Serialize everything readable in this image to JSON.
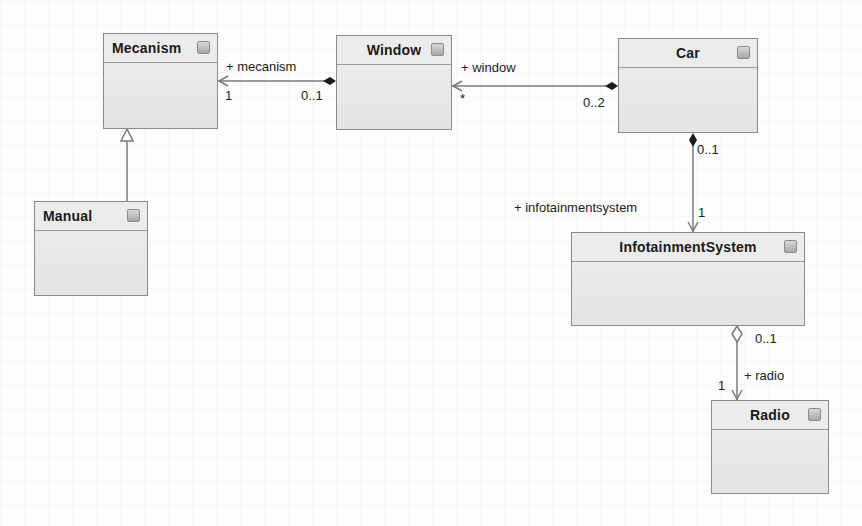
{
  "diagram": {
    "type": "UML class diagram",
    "classes": [
      {
        "id": "mecanism",
        "name": "Mecanism"
      },
      {
        "id": "window",
        "name": "Window"
      },
      {
        "id": "car",
        "name": "Car"
      },
      {
        "id": "manual",
        "name": "Manual"
      },
      {
        "id": "infotainment",
        "name": "InfotainmentSystem"
      },
      {
        "id": "radio",
        "name": "Radio"
      }
    ],
    "associations": [
      {
        "id": "window-mecanism",
        "from": "Window",
        "to": "Mecanism",
        "kind": "composition",
        "role": "+ mecanism",
        "source_multiplicity": "0..1",
        "target_multiplicity": "1"
      },
      {
        "id": "car-window",
        "from": "Car",
        "to": "Window",
        "kind": "composition",
        "role": "+ window",
        "source_multiplicity": "0..2",
        "target_multiplicity": "*"
      },
      {
        "id": "car-infotainment",
        "from": "Car",
        "to": "InfotainmentSystem",
        "kind": "composition",
        "role": "+ infotainmentsystem",
        "source_multiplicity": "0..1",
        "target_multiplicity": "1"
      },
      {
        "id": "infotainment-radio",
        "from": "InfotainmentSystem",
        "to": "Radio",
        "kind": "aggregation",
        "role": "+ radio",
        "source_multiplicity": "0..1",
        "target_multiplicity": "1"
      },
      {
        "id": "manual-mecanism",
        "from": "Manual",
        "to": "Mecanism",
        "kind": "generalization"
      }
    ]
  },
  "colors": {
    "box_border": "#8a8a8a",
    "box_fill": "#e8e8e8",
    "line": "#7a7a7a",
    "text": "#1a1a1a"
  }
}
